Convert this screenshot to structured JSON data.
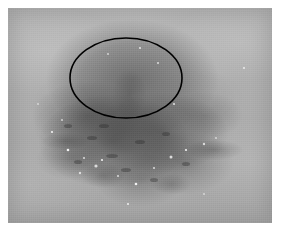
{
  "image": {
    "kind": "dermoscopy-photograph",
    "modality_label": "grayscale clinical skin photograph",
    "subject": "pigmented skin lesion",
    "alt_text": "Grayscale dermoscopic photograph of mottled skin showing a diffuse dark pigmented lesion, with a hand-drawn black ellipse outlining a region of interest in the upper portion of the lesion.",
    "plate": {
      "x": 8,
      "y": 8,
      "width": 264,
      "height": 215
    },
    "page_background": "#ffffff",
    "tones": {
      "skin_light": "#b7b7b7",
      "skin_mid": "#a6a6a6",
      "lesion_dark": "#6b6b6b",
      "lesion_darkest": "#555555",
      "annotation_stroke": "#000000",
      "highlight_speck": "#f2f2f2"
    }
  },
  "annotations": [
    {
      "id": "roi-ellipse",
      "shape": "ellipse",
      "label": "region of interest",
      "stroke_color": "#000000",
      "stroke_width": 1.6,
      "fill": "none",
      "center_x": 118,
      "center_y": 70,
      "radius_x": 56,
      "radius_y": 40,
      "rotation_deg": 0
    }
  ],
  "regions": [
    {
      "id": "upper-pigment-field",
      "label": "pigmented area inside ellipse",
      "center_x": 118,
      "center_y": 72
    },
    {
      "id": "lower-pigment-field",
      "label": "diffuse pigment extending below ellipse",
      "center_x": 110,
      "center_y": 135
    },
    {
      "id": "peripheral-skin",
      "label": "surrounding normal skin",
      "center_x": 230,
      "center_y": 40
    }
  ],
  "specks": [
    {
      "x": 60,
      "y": 142,
      "r": 1.3
    },
    {
      "x": 76,
      "y": 150,
      "r": 1.0
    },
    {
      "x": 88,
      "y": 158,
      "r": 1.6
    },
    {
      "x": 94,
      "y": 152,
      "r": 1.1
    },
    {
      "x": 72,
      "y": 165,
      "r": 1.2
    },
    {
      "x": 110,
      "y": 168,
      "r": 1.0
    },
    {
      "x": 128,
      "y": 176,
      "r": 1.3
    },
    {
      "x": 146,
      "y": 160,
      "r": 1.0
    },
    {
      "x": 163,
      "y": 149,
      "r": 1.5
    },
    {
      "x": 178,
      "y": 142,
      "r": 1.1
    },
    {
      "x": 196,
      "y": 136,
      "r": 1.2
    },
    {
      "x": 208,
      "y": 130,
      "r": 0.9
    },
    {
      "x": 44,
      "y": 124,
      "r": 1.1
    },
    {
      "x": 54,
      "y": 112,
      "r": 0.9
    },
    {
      "x": 150,
      "y": 55,
      "r": 1.0
    },
    {
      "x": 132,
      "y": 40,
      "r": 0.9
    },
    {
      "x": 100,
      "y": 46,
      "r": 0.9
    },
    {
      "x": 166,
      "y": 96,
      "r": 1.1
    },
    {
      "x": 120,
      "y": 196,
      "r": 1.0
    },
    {
      "x": 196,
      "y": 186,
      "r": 0.9
    },
    {
      "x": 30,
      "y": 96,
      "r": 0.9
    },
    {
      "x": 236,
      "y": 60,
      "r": 0.9
    }
  ],
  "flecks": [
    {
      "x": 84,
      "y": 130,
      "rx": 5,
      "ry": 2
    },
    {
      "x": 104,
      "y": 148,
      "rx": 6,
      "ry": 2
    },
    {
      "x": 132,
      "y": 134,
      "rx": 5,
      "ry": 2
    },
    {
      "x": 158,
      "y": 126,
      "rx": 4,
      "ry": 2
    },
    {
      "x": 70,
      "y": 154,
      "rx": 4,
      "ry": 2
    },
    {
      "x": 118,
      "y": 162,
      "rx": 5,
      "ry": 2
    },
    {
      "x": 146,
      "y": 172,
      "rx": 4,
      "ry": 2
    },
    {
      "x": 96,
      "y": 118,
      "rx": 5,
      "ry": 2
    },
    {
      "x": 178,
      "y": 156,
      "rx": 4,
      "ry": 2
    },
    {
      "x": 60,
      "y": 118,
      "rx": 4,
      "ry": 2
    }
  ]
}
